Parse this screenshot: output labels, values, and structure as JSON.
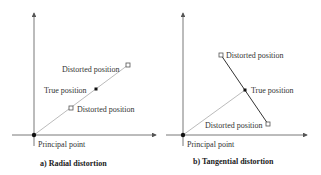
{
  "panels": [
    {
      "id": "a",
      "caption": "a)  Radial distortion",
      "labels": {
        "distorted_outer": "Distorted position",
        "true_position": "True position",
        "distorted_inner": "Distorted position",
        "principal_point": "Principal point"
      }
    },
    {
      "id": "b",
      "caption": "b)  Tangential distortion",
      "labels": {
        "distorted_upper": "Distorted position",
        "true_position": "True position",
        "distorted_lower": "Distorted position",
        "principal_point": "Principal point"
      }
    }
  ],
  "colors": {
    "axis": "#555555",
    "radial_line": "#aaaaaa",
    "tangential_line": "#333333",
    "marker": "#111111",
    "text": "#333333"
  }
}
